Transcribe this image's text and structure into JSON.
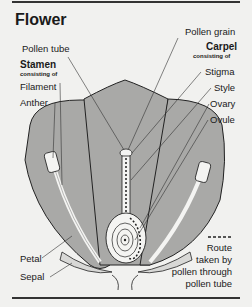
{
  "title": "Flower",
  "labels": {
    "pollen_tube": "Pollen tube",
    "stamen": "Stamen",
    "stamen_sub": "consisting of",
    "filament": "Filament",
    "anther": "Anther",
    "pollen_grain": "Pollen grain",
    "carpel": "Carpel",
    "carpel_sub": "consisting of",
    "stigma": "Stigma",
    "style": "Style",
    "ovary": "Ovary",
    "ovule": "Ovule",
    "petal": "Petal",
    "sepal": "Sepal"
  },
  "legend": {
    "symbol": "dashed-line",
    "lines": [
      "Route",
      "taken by",
      "pollen through",
      "pollen tube"
    ]
  },
  "colors": {
    "petal_fill": "#a9a9a7",
    "background": "#f1f1ef",
    "line": "#222222"
  }
}
